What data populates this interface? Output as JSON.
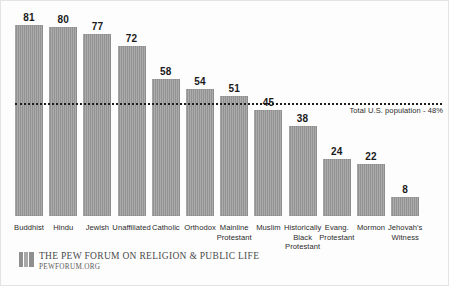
{
  "chart_data": {
    "type": "bar",
    "title": "",
    "subtitle": "",
    "xlabel": "",
    "ylabel": "",
    "ylim": [
      0,
      90
    ],
    "grid": false,
    "legend": "none",
    "orientation": "vertical",
    "categories": [
      "Buddhist",
      "Hindu",
      "Jewish",
      "Unaffiliated",
      "Catholic",
      "Orthodox",
      "Mainline Protestant",
      "Muslim",
      "Historically Black Protestant",
      "Evang. Protestant",
      "Mormon",
      "Jehovah's Witness"
    ],
    "values": [
      81,
      80,
      77,
      72,
      58,
      54,
      51,
      45,
      38,
      24,
      22,
      8
    ],
    "value_labels": [
      "81",
      "80",
      "77",
      "72",
      "58",
      "54",
      "51",
      "45",
      "38",
      "24",
      "22",
      "8"
    ],
    "bar_color": "#9b9b9b",
    "annotations": [
      {
        "type": "hline",
        "value": 48,
        "label": "Total U.S. population - 48%",
        "style": "dotted",
        "color": "#1c1c1c"
      }
    ]
  },
  "categories_display": [
    [
      "Buddhist"
    ],
    [
      "Hindu"
    ],
    [
      "Jewish"
    ],
    [
      "Unaffiliated"
    ],
    [
      "Catholic"
    ],
    [
      "Orthodox"
    ],
    [
      "Mainline",
      "Protestant"
    ],
    [
      "Muslim"
    ],
    [
      "Historically",
      "Black",
      "Protestant"
    ],
    [
      "Evang.",
      "Protestant"
    ],
    [
      "Mormon"
    ],
    [
      "Jehovah's",
      "Witness"
    ]
  ],
  "reference_line": {
    "label": "Total U.S. population - 48%",
    "value": 48
  },
  "footer": {
    "title": "THE PEW FORUM ON RELIGION & PUBLIC LIFE",
    "url": "PEWFORUM.ORG",
    "logo_name": "pew-forum-logo"
  }
}
